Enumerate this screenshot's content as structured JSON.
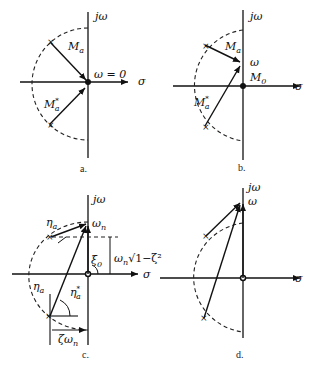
{
  "figure": {
    "panels": [
      {
        "id": "a",
        "caption": "a.",
        "axis_labels": {
          "vertical": "jω",
          "horizontal": "σ"
        },
        "annotations": {
          "vector_upper": "M",
          "vector_upper_sub": "a",
          "vector_lower": "M",
          "vector_lower_sub": "a",
          "vector_lower_sup": "*",
          "point": "ω = 0"
        }
      },
      {
        "id": "b",
        "caption": "b.",
        "axis_labels": {
          "vertical": "jω",
          "horizontal": "σ"
        },
        "annotations": {
          "vector_upper": "M",
          "vector_upper_sub": "a",
          "vector_lower": "M",
          "vector_lower_sub": "a",
          "vector_lower_sup": "*",
          "point": "ω",
          "origin_label": "M",
          "origin_label_sub": "0"
        }
      },
      {
        "id": "c",
        "caption": "c.",
        "axis_labels": {
          "vertical": "jω",
          "horizontal": "σ"
        },
        "annotations": {
          "angle_upper": "η",
          "angle_upper_sub": "a",
          "angle_lower": "η",
          "angle_lower_sub": "a",
          "angle_lower_star": "η",
          "angle_lower_star_sub": "a",
          "angle_lower_star_sup": "*",
          "point": "ω",
          "point_sub": "n",
          "origin_angle": "ξ",
          "origin_angle_sub": "0",
          "height_dim": "ω",
          "height_dim_sub": "n",
          "height_dim_sqrt": "√1−ζ²",
          "width_dim": "ζω",
          "width_dim_sub": "n"
        }
      },
      {
        "id": "d",
        "caption": "d.",
        "axis_labels": {
          "vertical": "jω",
          "horizontal": "σ"
        },
        "annotations": {
          "point": "ω"
        }
      }
    ]
  }
}
